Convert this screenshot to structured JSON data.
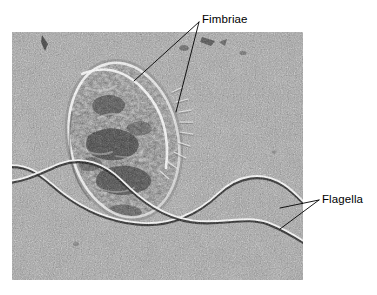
{
  "figure": {
    "type": "electron-micrograph",
    "caption_labels": [
      "Fimbriae",
      "Flagella"
    ],
    "background_color": "#ffffff"
  },
  "micrograph": {
    "name": "bacterial-cell-micrograph",
    "alt": "Transmission electron micrograph of a rod-shaped bacterial cell with fimbriae and two flagella",
    "frame": {
      "x": 12,
      "y": 32,
      "width": 291,
      "height": 248
    },
    "base_gray": "#9c9c9c",
    "grain_color_dark": "#4a4a4a",
    "grain_color_light": "#d8d8d8"
  },
  "cell": {
    "name": "bacterial-cell-body",
    "center_x": 112,
    "center_y": 108,
    "radius_x": 54,
    "radius_y": 78,
    "rotation_deg": -12,
    "fill": "#6b6b6b",
    "rim_highlight": "#f2f2f2"
  },
  "structures": {
    "fimbriae": {
      "label": "Fimbriae",
      "description": "Short hair-like appendages on the cell surface",
      "count": 9,
      "color": "#e8e8e8"
    },
    "flagella": {
      "label": "Flagella",
      "description": "Two long wavy whip-like appendages",
      "count": 2,
      "color": "#f0f0f0",
      "shadow_color": "#1c1c1c"
    }
  },
  "labels": {
    "fimbriae": {
      "text": "Fimbriae",
      "x": 202,
      "y": 13,
      "leader_origin": {
        "x": 199,
        "y": 22
      },
      "leader_targets": [
        {
          "x": 134,
          "y": 81
        },
        {
          "x": 176,
          "y": 112
        }
      ]
    },
    "flagella": {
      "text": "Flagella",
      "x": 322,
      "y": 193,
      "leader_origin": {
        "x": 319,
        "y": 200
      },
      "leader_targets": [
        {
          "x": 280,
          "y": 208
        },
        {
          "x": 280,
          "y": 229
        }
      ]
    }
  },
  "leader_line": {
    "color": "#000000",
    "width": 0.9
  }
}
